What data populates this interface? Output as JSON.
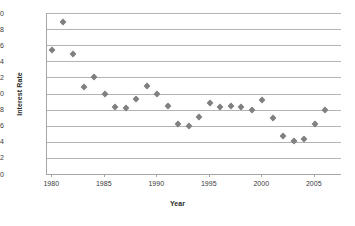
{
  "chart_data": {
    "type": "scatter",
    "title": "",
    "xlabel": "Year",
    "ylabel": "Interest Rate",
    "xlim": [
      1979.5,
      2007.5
    ],
    "ylim": [
      0,
      20
    ],
    "grid": true,
    "legend": null,
    "marker": {
      "shape": "diamond",
      "color": "#808080",
      "size": 5
    },
    "y_ticks": [
      0,
      2,
      4,
      6,
      8,
      10,
      12,
      14,
      16,
      18,
      20
    ],
    "x_ticks": [
      1980,
      1985,
      1990,
      1995,
      2000,
      2005
    ],
    "series": [
      {
        "name": "Interest Rate",
        "points": [
          {
            "x": 1980,
            "y": 15.4
          },
          {
            "x": 1981,
            "y": 18.9
          },
          {
            "x": 1982,
            "y": 14.9
          },
          {
            "x": 1983,
            "y": 10.8
          },
          {
            "x": 1984,
            "y": 12.1
          },
          {
            "x": 1985,
            "y": 9.9
          },
          {
            "x": 1986,
            "y": 8.3
          },
          {
            "x": 1987,
            "y": 8.2
          },
          {
            "x": 1988,
            "y": 9.3
          },
          {
            "x": 1989,
            "y": 10.9
          },
          {
            "x": 1990,
            "y": 10.0
          },
          {
            "x": 1991,
            "y": 8.5
          },
          {
            "x": 1992,
            "y": 6.2
          },
          {
            "x": 1993,
            "y": 6.0
          },
          {
            "x": 1994,
            "y": 7.1
          },
          {
            "x": 1995,
            "y": 8.8
          },
          {
            "x": 1996,
            "y": 8.3
          },
          {
            "x": 1997,
            "y": 8.4
          },
          {
            "x": 1998,
            "y": 8.3
          },
          {
            "x": 1999,
            "y": 8.0
          },
          {
            "x": 2000,
            "y": 9.2
          },
          {
            "x": 2001,
            "y": 6.9
          },
          {
            "x": 2002,
            "y": 4.7
          },
          {
            "x": 2003,
            "y": 4.1
          },
          {
            "x": 2004,
            "y": 4.3
          },
          {
            "x": 2005,
            "y": 6.2
          },
          {
            "x": 2006,
            "y": 7.9
          }
        ]
      }
    ]
  },
  "colors": {
    "marker": "#808080",
    "gridline": "#b3b3b3",
    "axis": "#a6a6a6",
    "text": "#3a3a3a",
    "background": "#ffffff"
  }
}
